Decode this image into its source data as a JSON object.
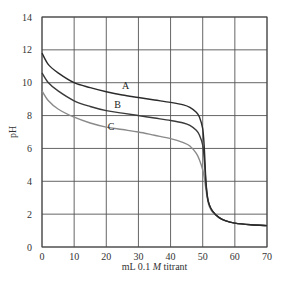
{
  "chart_data": {
    "type": "line",
    "title": "",
    "xlabel": "mL 0.1 M titrant",
    "xlabel_parts": {
      "pre": "mL 0.1 ",
      "italic": "M",
      "post": " titrant"
    },
    "ylabel": "pH",
    "xlim": [
      0,
      70
    ],
    "ylim": [
      0,
      14
    ],
    "x_ticks": [
      0,
      10,
      20,
      30,
      40,
      50,
      60,
      70
    ],
    "y_ticks": [
      0,
      2,
      4,
      6,
      8,
      10,
      12,
      14
    ],
    "grid": true,
    "legend": "inline labels",
    "series": [
      {
        "name": "A",
        "color": "#2b2b2b",
        "label_pos": [
          26,
          9.6
        ],
        "x": [
          0,
          2,
          5,
          10,
          15,
          20,
          25,
          30,
          35,
          40,
          44,
          46,
          48,
          49,
          50,
          50.5,
          51,
          51.5,
          52,
          53,
          55,
          57,
          60,
          65,
          70
        ],
        "y": [
          11.8,
          11.1,
          10.6,
          10.0,
          9.7,
          9.45,
          9.25,
          9.1,
          8.95,
          8.8,
          8.65,
          8.5,
          8.2,
          7.9,
          7.2,
          6.0,
          4.0,
          3.0,
          2.6,
          2.2,
          1.8,
          1.6,
          1.45,
          1.35,
          1.3
        ]
      },
      {
        "name": "B",
        "color": "#3a3a3a",
        "label_pos": [
          23.5,
          8.45
        ],
        "x": [
          0,
          2,
          5,
          10,
          15,
          20,
          25,
          30,
          35,
          40,
          44,
          46,
          48,
          49,
          50,
          50.5,
          51,
          51.5,
          52,
          53,
          55,
          57,
          60,
          65,
          70
        ],
        "y": [
          10.6,
          10.0,
          9.5,
          8.9,
          8.55,
          8.3,
          8.15,
          8.0,
          7.85,
          7.7,
          7.55,
          7.4,
          7.1,
          6.8,
          6.2,
          5.3,
          3.9,
          3.0,
          2.6,
          2.2,
          1.8,
          1.6,
          1.45,
          1.35,
          1.3
        ]
      },
      {
        "name": "C",
        "color": "#8a8a8a",
        "label_pos": [
          21.5,
          7.15
        ],
        "x": [
          0,
          2,
          5,
          10,
          15,
          20,
          25,
          30,
          35,
          40,
          44,
          46,
          48,
          49,
          50,
          50.5,
          51,
          51.5,
          52,
          53,
          55,
          57,
          60,
          65,
          70
        ],
        "y": [
          9.5,
          8.9,
          8.4,
          7.9,
          7.55,
          7.3,
          7.15,
          7.0,
          6.8,
          6.6,
          6.35,
          6.15,
          5.7,
          5.3,
          4.7,
          4.2,
          3.5,
          2.9,
          2.5,
          2.15,
          1.8,
          1.6,
          1.45,
          1.35,
          1.3
        ]
      }
    ]
  },
  "layout": {
    "plot_left": 42,
    "plot_right": 267,
    "plot_top": 17,
    "plot_bottom": 247,
    "grid_color": "#555555",
    "axis_color": "#444444"
  }
}
